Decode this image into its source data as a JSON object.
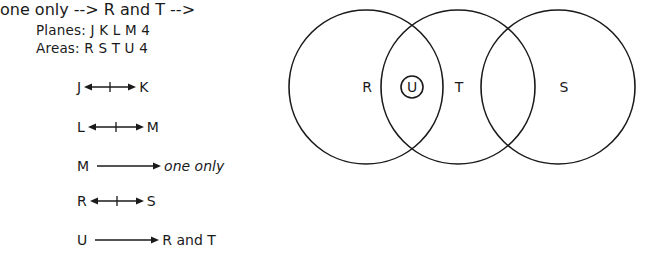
{
  "legend": {
    "planes_label": "Planes: J K L M 4",
    "areas_label": "Areas: R S T U 4"
  },
  "rules": [
    {
      "from": "J",
      "relation": "no-transfer-both-ways",
      "to": "K"
    },
    {
      "from": "L",
      "relation": "no-transfer-both-ways",
      "to": "M"
    },
    {
      "from": "M",
      "relation": "goes-to",
      "to": "one only"
    },
    {
      "from": "R",
      "relation": "no-transfer-both-ways",
      "to": "S"
    },
    {
      "from": "U",
      "relation": "goes-to",
      "to": "R and T"
    }
  ],
  "venn": {
    "circles": [
      {
        "label": "R",
        "cx": 366,
        "cy": 87,
        "r": 77
      },
      {
        "label": "T",
        "cx": 458,
        "cy": 87,
        "r": 77
      },
      {
        "label": "S",
        "cx": 558,
        "cy": 87,
        "r": 77
      }
    ],
    "inner_circle": {
      "label": "U",
      "cx": 412,
      "cy": 87,
      "r": 11
    },
    "labels": {
      "R": "R",
      "T": "T",
      "S": "S",
      "U": "U"
    },
    "stroke_color": "#1a1a1a"
  }
}
